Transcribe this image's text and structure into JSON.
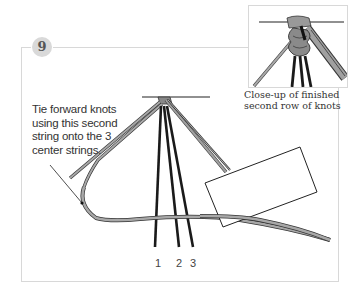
{
  "step": {
    "number": "9",
    "instruction": "Tie forward knots using this second string onto the 3 center strings."
  },
  "inset": {
    "caption_line1": "Close-up of finished",
    "caption_line2": "second row of knots"
  },
  "strands": {
    "labels": [
      "1",
      "2",
      "3"
    ]
  },
  "colors": {
    "frame": "#d8d8d8",
    "badge": "#d9d9d9",
    "cord_gray": "#9a9a9a",
    "cord_black": "#1a1a1a",
    "text": "#333333"
  }
}
